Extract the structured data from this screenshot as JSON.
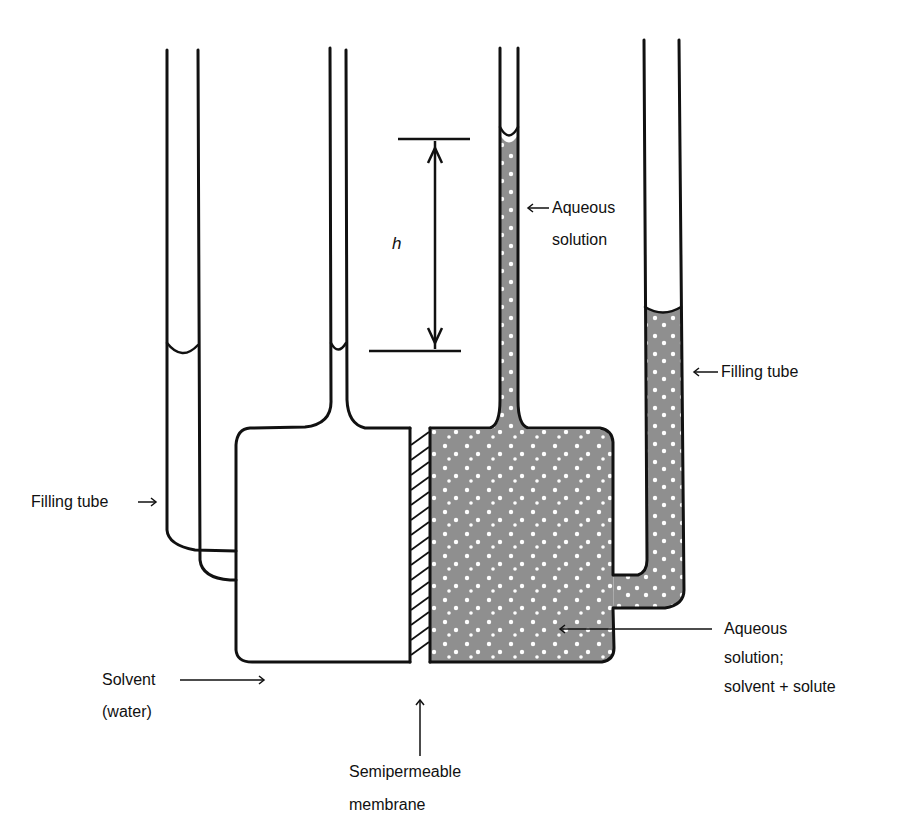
{
  "diagram": {
    "colors": {
      "line": "#111111",
      "solution_fill": "#8f8f8f",
      "solute_dot": "#ffffff",
      "background": "#ffffff"
    }
  },
  "labels": {
    "height": "h",
    "aqueous_solution_top_line1": "Aqueous",
    "aqueous_solution_top_line2": "solution",
    "filling_tube_right": "Filling tube",
    "filling_tube_left": "Filling tube",
    "solvent_line1": "Solvent",
    "solvent_line2": "(water)",
    "aqueous_solution_line1": "Aqueous",
    "aqueous_solution_line2": "solution;",
    "aqueous_solution_line3": "solvent + solute",
    "membrane_line1": "Semipermeable",
    "membrane_line2": "membrane"
  },
  "arrows": {
    "left_arrow": "←",
    "right_arrow": "→"
  }
}
